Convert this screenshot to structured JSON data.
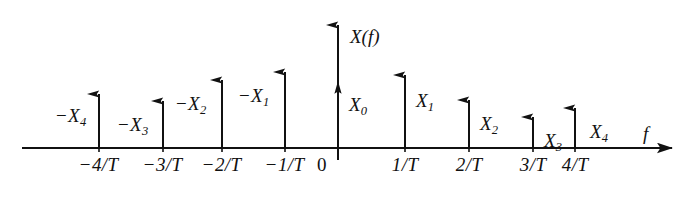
{
  "figure": {
    "background_color": "#ffffff",
    "ink_color": "#111111",
    "vertical_axis_label": "X(f)",
    "horizontal_axis_label": "f",
    "origin_label": "0"
  },
  "chart_data": {
    "type": "scatter",
    "title": "X(f)",
    "xlabel": "f",
    "ylabel": "X(f)",
    "grid": false,
    "legend": false,
    "plot_style": "stem / line spectrum (impulse train)",
    "xlim": [
      -4.6,
      5.2
    ],
    "ylim": [
      0,
      1.35
    ],
    "x_tick_labels": [
      "-4/T",
      "-3/T",
      "-2/T",
      "-1/T",
      "0",
      "1/T",
      "2/T",
      "3/T",
      "4/T"
    ],
    "x_tick_values": [
      -4,
      -3,
      -2,
      -1,
      0,
      1,
      2,
      3,
      4
    ],
    "point_labels": [
      "-X4",
      "-X3",
      "-X2",
      "-X1",
      "X0",
      "X1",
      "X2",
      "X3",
      "X4"
    ],
    "x": [
      -4,
      -3,
      -2,
      -1,
      0,
      1,
      2,
      3,
      4
    ],
    "values": [
      0.54,
      0.48,
      0.68,
      0.75,
      0.66,
      0.73,
      0.48,
      0.31,
      0.4
    ],
    "annotation": "Impulse heights are drawn schematically; the vertical axis arrow at f = 0 extends beyond the X0 impulse."
  },
  "impulses": [
    {
      "name": "impulse-neg-4",
      "x_px": 99,
      "top_px": 94,
      "tick": {
        "neg": true,
        "num": "4",
        "den": "T"
      },
      "amp": {
        "neg": true,
        "base": "X",
        "sub": "4"
      },
      "amp_side": "left",
      "amp_x_px": 56,
      "amp_y_px": 106
    },
    {
      "name": "impulse-neg-3",
      "x_px": 163,
      "top_px": 101,
      "tick": {
        "neg": true,
        "num": "3",
        "den": "T"
      },
      "amp": {
        "neg": true,
        "base": "X",
        "sub": "3"
      },
      "amp_side": "left",
      "amp_x_px": 118,
      "amp_y_px": 115
    },
    {
      "name": "impulse-neg-2",
      "x_px": 222,
      "top_px": 80,
      "tick": {
        "neg": true,
        "num": "2",
        "den": "T"
      },
      "amp": {
        "neg": true,
        "base": "X",
        "sub": "2"
      },
      "amp_side": "left",
      "amp_x_px": 176,
      "amp_y_px": 94
    },
    {
      "name": "impulse-neg-1",
      "x_px": 285,
      "top_px": 72,
      "tick": {
        "neg": true,
        "num": "1",
        "den": "T"
      },
      "amp": {
        "neg": true,
        "base": "X",
        "sub": "1"
      },
      "amp_side": "left",
      "amp_x_px": 239,
      "amp_y_px": 86
    },
    {
      "name": "impulse-zero",
      "x_px": 338,
      "top_px": 81,
      "tick": null,
      "amp": {
        "neg": false,
        "base": "X",
        "sub": "0"
      },
      "amp_side": "right",
      "amp_x_px": 349,
      "amp_y_px": 95
    },
    {
      "name": "impulse-pos-1",
      "x_px": 405,
      "top_px": 75,
      "tick": {
        "neg": false,
        "num": "1",
        "den": "T"
      },
      "amp": {
        "neg": false,
        "base": "X",
        "sub": "1"
      },
      "amp_side": "right",
      "amp_x_px": 416,
      "amp_y_px": 91
    },
    {
      "name": "impulse-pos-2",
      "x_px": 469,
      "top_px": 100,
      "tick": {
        "neg": false,
        "num": "2",
        "den": "T"
      },
      "amp": {
        "neg": false,
        "base": "X",
        "sub": "2"
      },
      "amp_side": "right",
      "amp_x_px": 480,
      "amp_y_px": 114
    },
    {
      "name": "impulse-pos-3",
      "x_px": 533,
      "top_px": 117,
      "tick": {
        "neg": false,
        "num": "3",
        "den": "T"
      },
      "amp": {
        "neg": false,
        "base": "X",
        "sub": "3"
      },
      "amp_side": "right",
      "amp_x_px": 544,
      "amp_y_px": 131
    },
    {
      "name": "impulse-pos-4",
      "x_px": 575,
      "top_px": 108,
      "tick": {
        "neg": false,
        "num": "4",
        "den": "T"
      },
      "amp": {
        "neg": false,
        "base": "X",
        "sub": "4"
      },
      "amp_side": "right",
      "amp_x_px": 590,
      "amp_y_px": 122
    }
  ],
  "geometry": {
    "baseline_y_px": 148,
    "axis_left_x_px": 22,
    "axis_right_x_px": 672,
    "vertical_axis_x_px": 338,
    "vertical_axis_top_px": 25,
    "vertical_axis_bottom_px": 160,
    "tick_label_y_px": 155,
    "vaxis_label_x_px": 350,
    "vaxis_label_y_px": 27,
    "haxis_label_x_px": 643,
    "haxis_label_y_px": 124,
    "origin_label_x_px": 317,
    "origin_label_y_px": 155
  }
}
